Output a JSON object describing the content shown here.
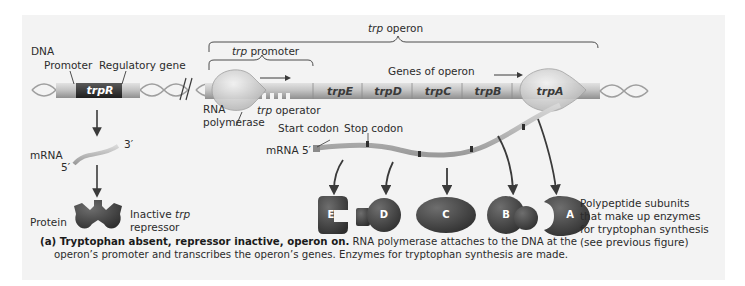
{
  "figure": {
    "labels": {
      "dna": "DNA",
      "promoter": "Promoter",
      "regulatory_gene": "Regulatory gene",
      "trpR": "trpR",
      "trp_operon_italic": "trp",
      "trp_operon_rest": " operon",
      "trp_promoter_italic": "trp",
      "trp_promoter_rest": " promoter",
      "genes_of_operon": "Genes of operon",
      "rna_polymerase_line1": "RNA",
      "rna_polymerase_line2": "polymerase",
      "trp_operator_italic": "trp",
      "trp_operator_rest": " operator",
      "start_codon": "Start codon",
      "stop_codon": "Stop codon",
      "mrna_left": "mRNA",
      "mrna_3prime": "3′",
      "mrna_5prime": "5′",
      "mrna_operon": "mRNA 5′",
      "protein": "Protein",
      "inactive_line1_a": "Inactive ",
      "inactive_line1_b": "trp",
      "inactive_line2": "repressor",
      "polypeptide_line1": "Polypeptide subunits",
      "polypeptide_line2": "that make up enzymes",
      "polypeptide_line3": "for tryptophan synthesis",
      "polypeptide_line4": "(see previous figure)"
    },
    "genes": [
      "trpE",
      "trpD",
      "trpC",
      "trpB",
      "trpA"
    ],
    "subunits": [
      "E",
      "D",
      "C",
      "B",
      "A"
    ],
    "caption": {
      "bold": "(a) Tryptophan absent, repressor inactive, operon on.",
      "text1": " RNA polymerase attaches to the DNA at the",
      "text2": "operon’s promoter and transcribes the operon’s genes. Enzymes for tryptophan synthesis are made."
    },
    "colors": {
      "panel": "#f3f3f3",
      "dna_tube": "#b8b8b8",
      "trpR_box": "#3a3a3a",
      "protein": "#4a4a4a",
      "polymerase": "#d4d4d4"
    }
  }
}
